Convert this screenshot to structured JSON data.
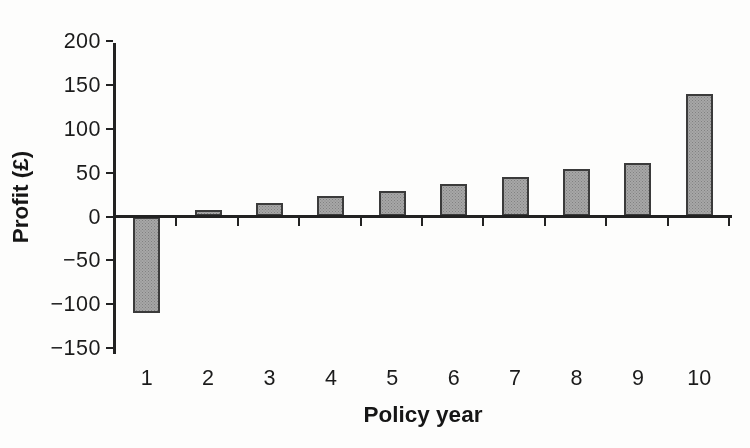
{
  "chart_data": {
    "type": "bar",
    "title": "",
    "xlabel": "Policy year",
    "ylabel": "Profit (£)",
    "categories": [
      "1",
      "2",
      "3",
      "4",
      "5",
      "6",
      "7",
      "8",
      "9",
      "10"
    ],
    "values": [
      -110,
      7,
      15,
      23,
      29,
      37,
      45,
      54,
      61,
      140
    ],
    "ylim": [
      -150,
      200
    ],
    "yticks": [
      200,
      150,
      100,
      50,
      0,
      -50,
      -100,
      -150
    ],
    "ytick_labels": [
      "200",
      "150",
      "100",
      "50",
      "0",
      "−50",
      "−100",
      "−150"
    ],
    "grid": false,
    "legend": null,
    "bar_fill_color": "#a7a7a7",
    "bar_border_color": "#3b3b3b",
    "axis_color": "#222222",
    "background_color": "#fdfdfc"
  }
}
